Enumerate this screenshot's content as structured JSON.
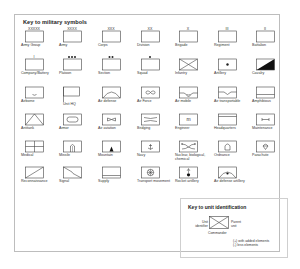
{
  "title": "Key to military symbols",
  "symbols": [
    {
      "label": "Army Group",
      "mark": "XXXXX"
    },
    {
      "label": "Army",
      "mark": "XXXX"
    },
    {
      "label": "Corps",
      "mark": "XXX"
    },
    {
      "label": "Division",
      "mark": "XX"
    },
    {
      "label": "Brigade",
      "mark": "X"
    },
    {
      "label": "Regiment",
      "mark": "III"
    },
    {
      "label": "Battalion",
      "mark": "II"
    },
    {
      "label": "Company/Battery",
      "mark": "I"
    },
    {
      "label": "Platoon",
      "mark": "●●●"
    },
    {
      "label": "Section",
      "mark": "●●"
    },
    {
      "label": "Squad",
      "mark": "●"
    },
    {
      "label": "Infantry"
    },
    {
      "label": "Artillery"
    },
    {
      "label": "Cavalry"
    },
    {
      "label": "Airborne"
    },
    {
      "label": "Unit HQ"
    },
    {
      "label": "Air defense"
    },
    {
      "label": "Air Force"
    },
    {
      "label": "Air mobile"
    },
    {
      "label": "Air transportable"
    },
    {
      "label": "Amphibious"
    },
    {
      "label": "Antitank"
    },
    {
      "label": "Armor"
    },
    {
      "label": "Air aviation"
    },
    {
      "label": "Bridging"
    },
    {
      "label": "Engineer",
      "mark": "m"
    },
    {
      "label": "Headquarters"
    },
    {
      "label": "Maintenance"
    },
    {
      "label": "Medical"
    },
    {
      "label": "Missile"
    },
    {
      "label": "Mountain"
    },
    {
      "label": "Navy"
    },
    {
      "label": "Nuclear, biological, chemical"
    },
    {
      "label": "Ordnance"
    },
    {
      "label": "Parachute"
    },
    {
      "label": "Reconnaissance"
    },
    {
      "label": "Signal"
    },
    {
      "label": "Supply"
    },
    {
      "label": "Transport movement"
    },
    {
      "label": "Rocket artillery"
    },
    {
      "label": "Air defense artillery"
    }
  ],
  "unit_key": {
    "title": "Key to unit identification",
    "left_label": "Unit identifier",
    "right_label": "Parent unit",
    "bottom_label": "Commander",
    "note_1": "(+) with added elements",
    "note_2": "(-) less elements"
  }
}
